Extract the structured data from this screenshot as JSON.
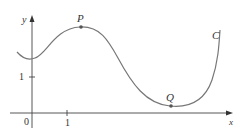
{
  "diagram": {
    "type": "function-graph",
    "axes": {
      "x_label": "x",
      "y_label": "y",
      "origin_label": "0"
    },
    "ticks": {
      "x_tick": "1",
      "y_tick": "1"
    },
    "curve_label": "C",
    "points": [
      {
        "name": "P",
        "role": "local maximum"
      },
      {
        "name": "Q",
        "role": "local minimum"
      }
    ],
    "colors": {
      "axis": "#444444",
      "curve": "#777777",
      "text": "#333333"
    }
  }
}
